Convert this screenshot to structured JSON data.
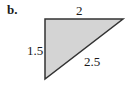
{
  "figure": {
    "part_label": "b.",
    "shape": "right-triangle",
    "fill_color": "#d4d4d4",
    "stroke_color": "#333333",
    "vertices": {
      "right_angle": [
        45,
        19
      ],
      "top_right": [
        123,
        19
      ],
      "bottom_left": [
        45,
        79
      ]
    },
    "sides": {
      "top": "2",
      "left": "1.5",
      "hypotenuse": "2.5"
    }
  }
}
